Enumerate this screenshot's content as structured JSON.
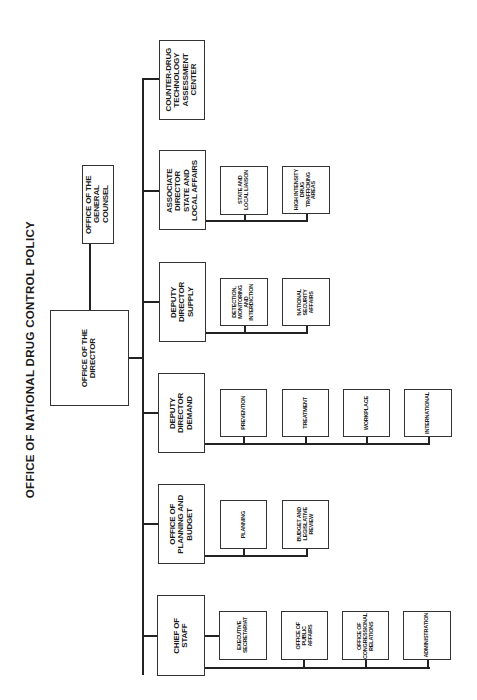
{
  "title": "OFFICE OF NATIONAL DRUG CONTROL POLICY",
  "director": {
    "label": "OFFICE OF THE\nDIRECTOR"
  },
  "general_counsel": {
    "label": "OFFICE OF THE\nGENERAL COUNSEL"
  },
  "units": [
    {
      "label": "COUNTER-DRUG\nTECHNOLOGY\nASSESSMENT\nCENTER",
      "children": []
    },
    {
      "label": "ASSOCIATE\nDIRECTOR\nSTATE AND\nLOCAL AFFAIRS",
      "children": [
        "STATE AND\nLOCAL LIAISON",
        "HIGH INTENSITY\nDRUG\nTRAFFICKING\nAREAS"
      ]
    },
    {
      "label": "DEPUTY\nDIRECTOR\nSUPPLY",
      "children": [
        "DETECTION,\nMONITORING\nAND\nINTERDICTION",
        "NATIONAL\nSECURITY\nAFFAIRS"
      ]
    },
    {
      "label": "DEPUTY\nDIRECTOR\nDEMAND",
      "children": [
        "PREVENTION",
        "TREATMENT",
        "WORKPLACE",
        "INTERNATIONAL"
      ]
    },
    {
      "label": "OFFICE OF\nPLANNING AND\nBUDGET",
      "children": [
        "PLANNING",
        "BUDGET AND\nLEGISLATIVE\nREVIEW"
      ]
    },
    {
      "label": "CHIEF OF\nSTAFF",
      "children": [
        "EXECUTIVE\nSECRETARIAT",
        "OFFICE OF\nPUBLIC\nAFFAIRS",
        "OFFICE OF\nCONGRESSIONAL\nRELATIONS",
        "ADMINISTRATION"
      ]
    }
  ]
}
